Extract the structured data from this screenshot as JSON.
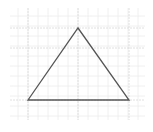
{
  "diagram": {
    "type": "triangle-on-grid",
    "colors": {
      "background": "#ffffff",
      "grid_minor": "#ececec",
      "grid_major": "#dcdcdc",
      "shape_stroke": "#555555"
    },
    "grid": {
      "x_start": 10,
      "x_end": 145,
      "y_start": 8,
      "y_end": 120,
      "spacing": 10
    },
    "triangle": {
      "vertices": [
        {
          "name": "left",
          "x": 28,
          "y": 100
        },
        {
          "name": "apex",
          "x": 78,
          "y": 28
        },
        {
          "name": "right",
          "x": 129,
          "y": 100
        }
      ]
    }
  }
}
